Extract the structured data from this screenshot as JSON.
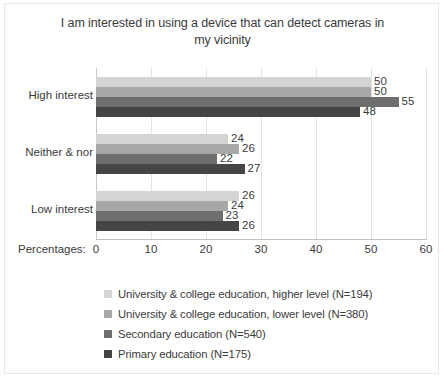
{
  "chart_data": {
    "type": "bar",
    "orientation": "horizontal",
    "title": "I am interested in using a device that can detect cameras in my vicinity",
    "title_line1": "I am interested in using a device that can detect cameras in",
    "title_line2": "my vicinity",
    "xlabel": "Percentages:",
    "ylabel": "",
    "categories": [
      "High interest",
      "Neither & nor",
      "Low interest"
    ],
    "xlim": [
      0,
      60
    ],
    "xticks": [
      0,
      10,
      20,
      30,
      40,
      50,
      60
    ],
    "xtick_labels": [
      "0",
      "10",
      "20",
      "30",
      "40",
      "50",
      "60"
    ],
    "grid": true,
    "legend_position": "bottom-left",
    "series": [
      {
        "name": "University & college education, higher level  (N=194)",
        "color": "#d4d4d4",
        "values": [
          50,
          24,
          26
        ]
      },
      {
        "name": "University & college education, lower level  (N=380)",
        "color": "#a8a8a8",
        "values": [
          50,
          26,
          24
        ]
      },
      {
        "name": "Secondary education (N=540)",
        "color": "#6e6e6e",
        "values": [
          55,
          22,
          23
        ]
      },
      {
        "name": "Primary education (N=175)",
        "color": "#454545",
        "values": [
          48,
          27,
          26
        ]
      }
    ],
    "data_labels": {
      "High interest": [
        "50",
        "50",
        "55",
        "48"
      ],
      "Neither & nor": [
        "24",
        "26",
        "22",
        "27"
      ],
      "Low interest": [
        "26",
        "24",
        "23",
        "26"
      ]
    }
  }
}
